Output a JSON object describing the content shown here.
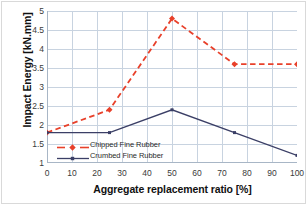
{
  "chart_data": {
    "type": "line",
    "title": "",
    "xlabel": "Aggregate replacement ratio [%]",
    "ylabel": "Impact Energy [kN.mm]",
    "x": [
      0,
      25,
      50,
      75,
      100
    ],
    "xlim": [
      0,
      100
    ],
    "ylim": [
      1,
      5
    ],
    "xticks": [
      0,
      10,
      20,
      30,
      40,
      50,
      60,
      70,
      80,
      90,
      100
    ],
    "yticks": [
      1,
      1.5,
      2,
      2.5,
      3,
      3.5,
      4,
      4.5,
      5
    ],
    "xtick_labels": [
      "0",
      "10",
      "20",
      "30",
      "40",
      "50",
      "60",
      "70",
      "80",
      "90",
      "100"
    ],
    "ytick_labels": [
      "1",
      "1.5",
      "2",
      "2.5",
      "3",
      "3.5",
      "4",
      "4.5",
      "5"
    ],
    "grid": true,
    "legend_position": "inside-lower-left",
    "series": [
      {
        "name": "Chipped Fine Rubber",
        "values": [
          1.8,
          2.4,
          4.8,
          3.6,
          3.6
        ],
        "color": "#e8402a",
        "style": "dashed",
        "marker": "diamond"
      },
      {
        "name": "Crumbed Fine Rubber",
        "values": [
          1.8,
          1.8,
          2.4,
          1.8,
          1.2
        ],
        "color": "#3b3f66",
        "style": "solid",
        "marker": "square"
      }
    ]
  },
  "legend": {
    "items": [
      {
        "label": "Chipped Fine Rubber"
      },
      {
        "label": "Crumbed Fine Rubber"
      }
    ]
  },
  "colors": {
    "chipped": "#e8402a",
    "crumbed": "#3b3f66",
    "grid": "#c8d3e0",
    "frame": "#d9d9d9",
    "background": "#ffffff"
  }
}
